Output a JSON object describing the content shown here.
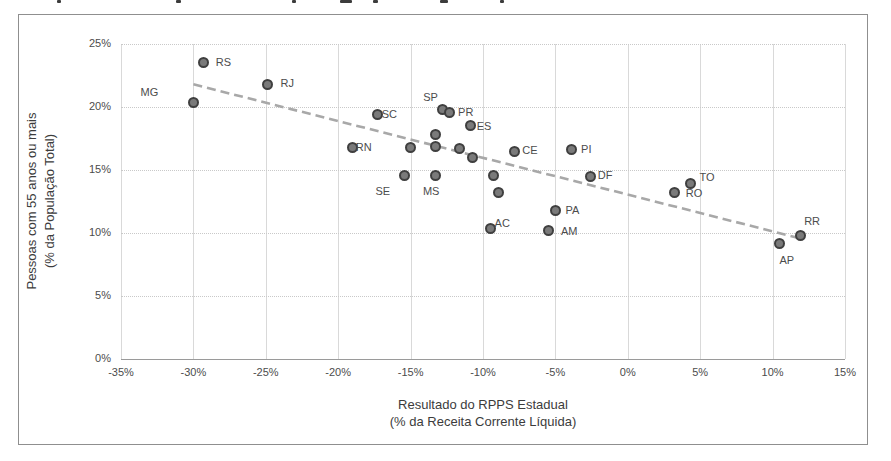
{
  "chart_data": {
    "type": "scatter",
    "title": "",
    "xlabel_line1": "Resultado do RPPS Estadual",
    "xlabel_line2": "(% da Receita Corrente Líquida)",
    "ylabel_line1": "Pessoas com 55 anos ou mais",
    "ylabel_line2": "(% da População Total)",
    "xlim": [
      -35,
      15
    ],
    "ylim": [
      0,
      25
    ],
    "grid": true,
    "x_tick_values": [
      -35,
      -30,
      -25,
      -20,
      -15,
      -10,
      -5,
      0,
      5,
      10,
      15
    ],
    "x_tick_labels": [
      "-35%",
      "-30%",
      "-25%",
      "-20%",
      "-15%",
      "-10%",
      "-5%",
      "0%",
      "5%",
      "10%",
      "15%"
    ],
    "y_tick_values": [
      0,
      5,
      10,
      15,
      20,
      25
    ],
    "y_tick_labels": [
      "0%",
      "5%",
      "10%",
      "15%",
      "20%",
      "25%"
    ],
    "colors": {
      "marker_fill": "#7a7a7a",
      "marker_edge": "#3f3f3f",
      "trend": "#a8a8a8",
      "grid": "#d9d9d9"
    },
    "points": [
      {
        "label": "MG",
        "x": -30.0,
        "y": 20.4,
        "dx": -44,
        "dy": -10
      },
      {
        "label": "RS",
        "x": -29.3,
        "y": 23.5,
        "dx": 20,
        "dy": -1
      },
      {
        "label": "RJ",
        "x": -24.9,
        "y": 21.8,
        "dx": 20,
        "dy": -1
      },
      {
        "label": "RN",
        "x": -19.0,
        "y": 16.8,
        "dx": 11,
        "dy": 0
      },
      {
        "label": "SC",
        "x": -17.3,
        "y": 19.4,
        "dx": 12,
        "dy": -1
      },
      {
        "label": "SE",
        "x": -15.4,
        "y": 14.6,
        "dx": -22,
        "dy": 16
      },
      {
        "label": "",
        "x": -15.0,
        "y": 16.8,
        "dx": 0,
        "dy": 0
      },
      {
        "label": "",
        "x": -13.3,
        "y": 17.8,
        "dx": 0,
        "dy": 0
      },
      {
        "label": "",
        "x": -13.3,
        "y": 16.9,
        "dx": 0,
        "dy": 0
      },
      {
        "label": "MS",
        "x": -13.3,
        "y": 14.6,
        "dx": -4,
        "dy": 16
      },
      {
        "label": "SP",
        "x": -12.8,
        "y": 19.8,
        "dx": -12,
        "dy": -13
      },
      {
        "label": "PR",
        "x": -12.3,
        "y": 19.6,
        "dx": 16,
        "dy": 0
      },
      {
        "label": "",
        "x": -11.6,
        "y": 16.7,
        "dx": 0,
        "dy": 0
      },
      {
        "label": "ES",
        "x": -10.9,
        "y": 18.5,
        "dx": 14,
        "dy": 0
      },
      {
        "label": "",
        "x": -10.7,
        "y": 16.0,
        "dx": 0,
        "dy": 0
      },
      {
        "label": "AC",
        "x": -9.5,
        "y": 10.4,
        "dx": 12,
        "dy": -5
      },
      {
        "label": "",
        "x": -9.3,
        "y": 14.6,
        "dx": 0,
        "dy": 0
      },
      {
        "label": "",
        "x": -8.9,
        "y": 13.2,
        "dx": 0,
        "dy": 0
      },
      {
        "label": "CE",
        "x": -7.8,
        "y": 16.5,
        "dx": 15,
        "dy": -1
      },
      {
        "label": "AM",
        "x": -5.5,
        "y": 10.2,
        "dx": 21,
        "dy": 0
      },
      {
        "label": "PA",
        "x": -5.0,
        "y": 11.8,
        "dx": 17,
        "dy": 0
      },
      {
        "label": "PI",
        "x": -3.9,
        "y": 16.6,
        "dx": 15,
        "dy": -1
      },
      {
        "label": "DF",
        "x": -2.6,
        "y": 14.5,
        "dx": 15,
        "dy": -1
      },
      {
        "label": "RO",
        "x": 3.2,
        "y": 13.2,
        "dx": 20,
        "dy": 0
      },
      {
        "label": "TO",
        "x": 4.3,
        "y": 13.9,
        "dx": 17,
        "dy": -7
      },
      {
        "label": "AP",
        "x": 10.5,
        "y": 9.2,
        "dx": 7,
        "dy": 17
      },
      {
        "label": "RR",
        "x": 11.9,
        "y": 9.8,
        "dx": 12,
        "dy": -15
      }
    ],
    "trendline": {
      "x1": -30.0,
      "y1": 21.8,
      "x2": 11.8,
      "y2": 9.6,
      "style": "dashed"
    }
  },
  "top_edge_text_fragments": [
    {
      "x": 57,
      "w": 4
    },
    {
      "x": 176,
      "w": 5
    },
    {
      "x": 292,
      "w": 4
    },
    {
      "x": 340,
      "w": 12
    },
    {
      "x": 373,
      "w": 5
    },
    {
      "x": 440,
      "w": 8
    },
    {
      "x": 500,
      "w": 4
    }
  ]
}
